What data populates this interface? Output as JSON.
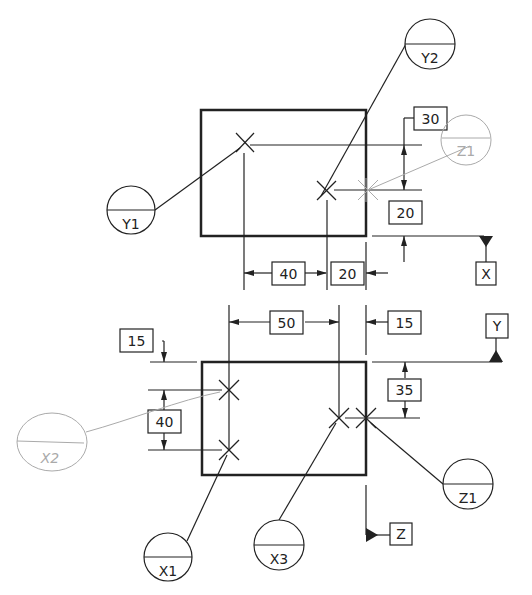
{
  "drawing": {
    "top_view": {
      "dimensions": {
        "d30": "30",
        "d20_right": "20",
        "d40": "40",
        "d20_bottom": "20"
      },
      "balloons": {
        "y1": "Y1",
        "y2": "Y2",
        "z1_faint": "Z1"
      },
      "datum": "X"
    },
    "bottom_view": {
      "dimensions": {
        "d50": "50",
        "d15_top": "15",
        "d15_left": "15",
        "d40": "40",
        "d35": "35"
      },
      "balloons": {
        "x1": "X1",
        "x2_faint": "X2",
        "x3": "X3",
        "z1": "Z1"
      },
      "datums": {
        "y": "Y",
        "z": "Z"
      }
    }
  },
  "colors": {
    "ink": "#222222",
    "faint": "#aaaaaa"
  }
}
